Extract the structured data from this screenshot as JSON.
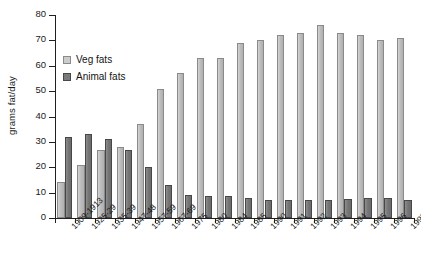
{
  "chart_data": {
    "type": "bar",
    "title": "",
    "xlabel": "",
    "ylabel": "grams fat/day",
    "ylim": [
      0,
      80
    ],
    "yticks": [
      0,
      10,
      20,
      30,
      40,
      50,
      60,
      70,
      80
    ],
    "grid": false,
    "legend_position": "upper-left-inside",
    "categories": [
      "1909-1913",
      "1925-29",
      "1935-39",
      "1947-48",
      "1957-59",
      "1967-69",
      "1975",
      "1980",
      "1984",
      "1985",
      "1990",
      "1991",
      "1992",
      "1993",
      "1994",
      "1995",
      "1996",
      "1997"
    ],
    "series": [
      {
        "name": "Veg fats",
        "color": "#c2c2c2",
        "values": [
          14,
          21,
          27,
          28,
          37,
          51,
          57,
          63,
          63,
          69,
          70,
          72,
          73,
          76,
          73,
          72,
          70,
          71
        ]
      },
      {
        "name": "Animal fats",
        "color": "#787878",
        "values": [
          32,
          33,
          31,
          27,
          20,
          13,
          9,
          8.5,
          8.5,
          8,
          7,
          7,
          7,
          7,
          7.5,
          8,
          8,
          7
        ]
      }
    ]
  },
  "legend": {
    "items": [
      {
        "label": "Veg fats",
        "swatch": "veg"
      },
      {
        "label": "Animal fats",
        "swatch": "animal"
      }
    ]
  }
}
